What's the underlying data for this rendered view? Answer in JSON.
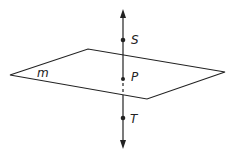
{
  "diagram": {
    "plane": {
      "label": "m",
      "vertices": [
        [
          10,
          75
        ],
        [
          88,
          49
        ],
        [
          225,
          72
        ],
        [
          147,
          99
        ]
      ]
    },
    "line": {
      "x": 123,
      "y_top": 10,
      "y_bottom": 148
    },
    "points": [
      {
        "label": "S",
        "x": 123,
        "y": 40
      },
      {
        "label": "P",
        "x": 123,
        "y": 79
      },
      {
        "label": "T",
        "x": 123,
        "y": 118
      }
    ],
    "colors": {
      "stroke": "#222222",
      "background": "#ffffff"
    }
  }
}
